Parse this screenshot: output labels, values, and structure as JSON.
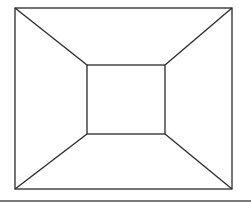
{
  "diagram": {
    "type": "wireframe-box-perspective",
    "stroke_color": "#2a2a2a",
    "bottom_rule_color": "#7a7a7a",
    "outer_rect": {
      "x1": 15,
      "y1": 8,
      "x2": 232,
      "y2": 189
    },
    "inner_rect": {
      "x1": 87,
      "y1": 65,
      "x2": 165,
      "y2": 134
    }
  }
}
